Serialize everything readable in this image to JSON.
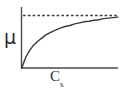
{
  "figure": {
    "background_color": "#ffffff",
    "line_color": "#3a3a3a",
    "axis_color": "#4a4a4a"
  },
  "axes": {
    "y_label": "μ",
    "x_label_base": "C",
    "x_label_sub": "s"
  },
  "chart_data": {
    "type": "line",
    "title": "",
    "subtitle": "",
    "xlabel": "C_s",
    "ylabel": "μ",
    "xlim": [
      0,
      1
    ],
    "ylim": [
      0,
      1.08
    ],
    "grid": false,
    "legend": null,
    "legend_position": "none",
    "axis_ticks": {
      "x_ticks": [],
      "y_ticks": [],
      "x_ticklabels": [],
      "y_ticklabels": []
    },
    "annotations": [
      {
        "name": "asymptote",
        "style": "dashed",
        "orientation": "horizontal",
        "y_value": 1.0,
        "label": ""
      }
    ],
    "series": [
      {
        "name": "saturation-curve",
        "style": "solid",
        "description": "Monod / Michaelis-Menten saturation curve rising from the origin and approaching the dashed asymptote",
        "x": [
          0,
          0.04,
          0.08,
          0.12,
          0.16,
          0.2,
          0.25,
          0.3,
          0.35,
          0.4,
          0.45,
          0.5,
          0.55,
          0.6,
          0.65,
          0.7,
          0.75,
          0.8,
          0.85,
          0.9,
          0.95,
          1.0
        ],
        "y": [
          0,
          0.2,
          0.33,
          0.43,
          0.5,
          0.56,
          0.63,
          0.68,
          0.72,
          0.76,
          0.79,
          0.81,
          0.84,
          0.86,
          0.88,
          0.89,
          0.91,
          0.92,
          0.94,
          0.95,
          0.96,
          0.97
        ]
      }
    ]
  }
}
